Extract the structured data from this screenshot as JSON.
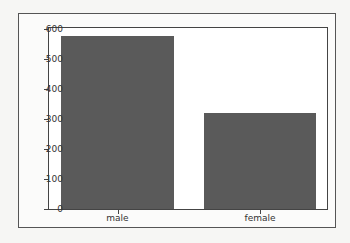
{
  "chart_data": {
    "type": "bar",
    "title": "",
    "xlabel": "",
    "ylabel": "",
    "categories": [
      "male",
      "female"
    ],
    "values": [
      577,
      321
    ],
    "ylim": [
      0,
      610
    ],
    "yticks": [
      0,
      100,
      200,
      300,
      400,
      500,
      600
    ],
    "ytick_labels": [
      "0",
      "100",
      "200",
      "300",
      "400",
      "500",
      "600"
    ],
    "grid": false,
    "legend": null,
    "bar_color": "#5a5a5a"
  }
}
